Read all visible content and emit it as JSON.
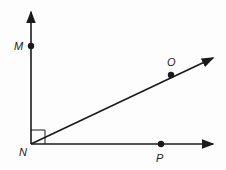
{
  "diagram": {
    "type": "geometry-angle",
    "vertex": {
      "label": "N",
      "x": 31,
      "y": 144
    },
    "points": [
      {
        "label": "M",
        "x": 31,
        "y": 46
      },
      {
        "label": "O",
        "x": 171,
        "y": 75
      },
      {
        "label": "P",
        "x": 161,
        "y": 144
      }
    ],
    "rays": [
      "NM",
      "NO",
      "NP"
    ],
    "right_angle": "MNP",
    "colors": {
      "stroke": "#1a1a1a",
      "background": "#fdfdfd"
    }
  }
}
